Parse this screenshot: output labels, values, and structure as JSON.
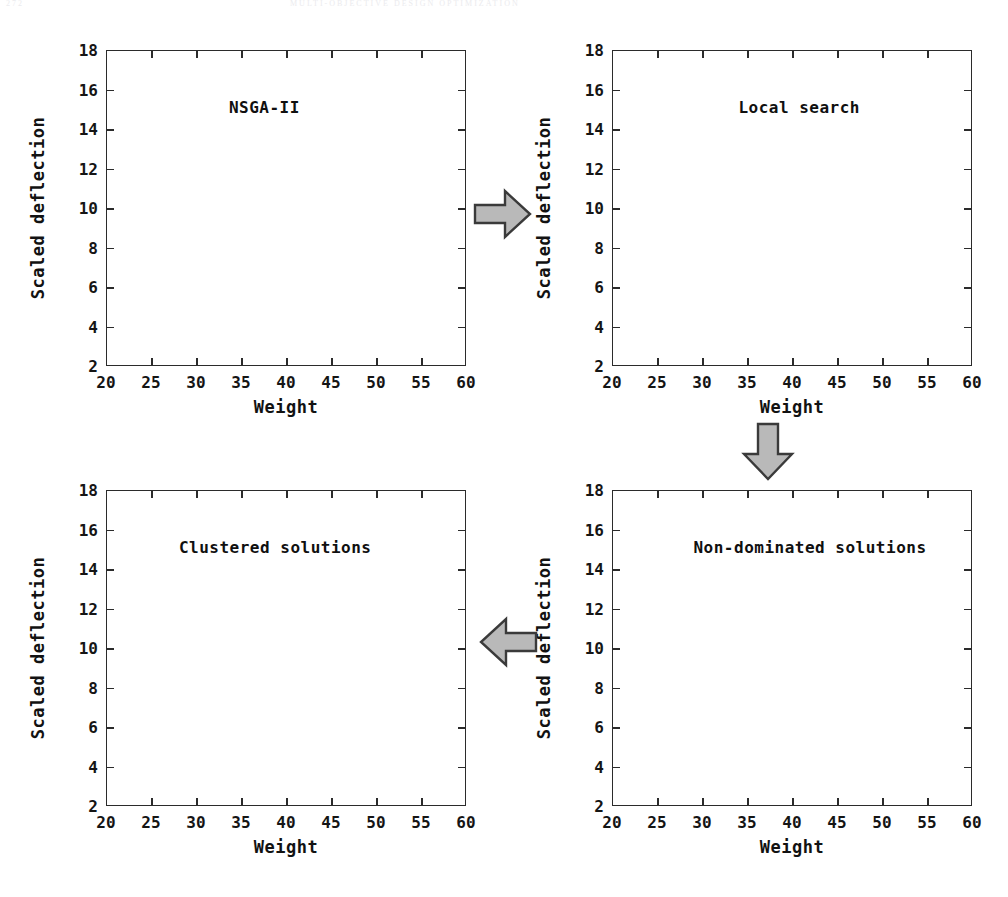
{
  "page_header": {
    "left": "272",
    "center": "MULTI-OBJECTIVE DESIGN OPTIMIZATION"
  },
  "axis": {
    "xlabel": "Weight",
    "ylabel": "Scaled deflection",
    "xticks": [
      20,
      25,
      30,
      35,
      40,
      45,
      50,
      55,
      60
    ],
    "yticks": [
      2,
      4,
      6,
      8,
      10,
      12,
      14,
      16,
      18
    ],
    "xlim": [
      20,
      60
    ],
    "ylim": [
      2,
      18
    ]
  },
  "arrows": [
    {
      "name": "arrow-nsga-to-local",
      "direction": "right"
    },
    {
      "name": "arrow-local-to-nondominated",
      "direction": "down"
    },
    {
      "name": "arrow-nondominated-to-clustered",
      "direction": "left"
    }
  ],
  "colors": {
    "axis": "#2b2b2b",
    "marker_stroke": "#4b4b52",
    "marker_fill": "#fbfbfb",
    "arrow_fill": "#b9b9b9",
    "arrow_stroke": "#3a3a3a",
    "text": "#111111"
  },
  "chart_data": [
    {
      "name": "nsga-ii",
      "type": "scatter",
      "title": "NSGA-II",
      "xlabel": "Weight",
      "ylabel": "Scaled deflection",
      "xlim": [
        20,
        60
      ],
      "ylim": [
        2,
        18
      ],
      "xticks": [
        20,
        25,
        30,
        35,
        40,
        45,
        50,
        55,
        60
      ],
      "yticks": [
        2,
        4,
        6,
        8,
        10,
        12,
        14,
        16,
        18
      ],
      "grid": false,
      "legend": "none",
      "points": [
        [
          24.9,
          10.9
        ],
        [
          25.9,
          10.2
        ],
        [
          27.7,
          9.3
        ],
        [
          28.3,
          7.85
        ],
        [
          28.8,
          7.6
        ],
        [
          29.5,
          6.65
        ],
        [
          30.2,
          6.5
        ],
        [
          30.5,
          6.45
        ],
        [
          31.0,
          6.05
        ],
        [
          31.6,
          5.05
        ],
        [
          33.6,
          4.6
        ],
        [
          33.9,
          4.15
        ],
        [
          35.2,
          3.8
        ],
        [
          35.6,
          3.75
        ],
        [
          36.0,
          3.7
        ],
        [
          37.5,
          3.35
        ],
        [
          38.2,
          3.3
        ],
        [
          40.2,
          3.25
        ],
        [
          41.9,
          3.15
        ],
        [
          42.6,
          3.05
        ],
        [
          43.5,
          3.0
        ],
        [
          44.0,
          2.95
        ],
        [
          44.8,
          2.95
        ],
        [
          46.5,
          2.85
        ],
        [
          46.9,
          2.85
        ],
        [
          48.2,
          2.8
        ],
        [
          49.4,
          2.7
        ],
        [
          50.0,
          2.68
        ],
        [
          51.5,
          2.6
        ],
        [
          53.0,
          2.58
        ],
        [
          55.0,
          2.5
        ],
        [
          55.7,
          2.48
        ]
      ]
    },
    {
      "name": "local-search",
      "type": "scatter",
      "title": "Local search",
      "xlabel": "Weight",
      "ylabel": "Scaled deflection",
      "xlim": [
        20,
        60
      ],
      "ylim": [
        2,
        18
      ],
      "xticks": [
        20,
        25,
        30,
        35,
        40,
        45,
        50,
        55,
        60
      ],
      "yticks": [
        2,
        4,
        6,
        8,
        10,
        12,
        14,
        16,
        18
      ],
      "grid": false,
      "legend": "none",
      "points": [
        [
          21.8,
          16.25
        ],
        [
          21.9,
          14.25
        ],
        [
          22.0,
          13.55
        ],
        [
          23.5,
          6.6
        ],
        [
          28.4,
          5.2
        ],
        [
          29.0,
          4.7
        ],
        [
          29.3,
          4.7
        ],
        [
          29.9,
          4.7
        ],
        [
          30.2,
          4.7
        ],
        [
          32.6,
          3.9
        ],
        [
          32.9,
          3.88
        ],
        [
          33.4,
          3.78
        ],
        [
          33.8,
          3.68
        ],
        [
          34.0,
          3.65
        ],
        [
          34.9,
          3.6
        ],
        [
          35.2,
          3.55
        ],
        [
          35.4,
          3.52
        ],
        [
          37.5,
          3.25
        ],
        [
          40.4,
          3.05
        ],
        [
          47.1,
          2.68
        ],
        [
          47.8,
          2.65
        ],
        [
          53.2,
          2.5
        ],
        [
          55.0,
          2.45
        ],
        [
          57.0,
          2.42
        ],
        [
          59.0,
          2.4
        ]
      ]
    },
    {
      "name": "non-dominated-solutions",
      "type": "scatter",
      "title": "Non-dominated solutions",
      "xlabel": "Weight",
      "ylabel": "Scaled deflection",
      "xlim": [
        20,
        60
      ],
      "ylim": [
        2,
        18
      ],
      "xticks": [
        20,
        25,
        30,
        35,
        40,
        45,
        50,
        55,
        60
      ],
      "yticks": [
        2,
        4,
        6,
        8,
        10,
        12,
        14,
        16,
        18
      ],
      "grid": false,
      "legend": "none",
      "points": [
        [
          21.8,
          16.25
        ],
        [
          21.9,
          14.25
        ],
        [
          22.0,
          13.55
        ],
        [
          23.5,
          6.6
        ],
        [
          28.4,
          5.2
        ],
        [
          29.0,
          4.7
        ],
        [
          29.3,
          4.7
        ],
        [
          29.9,
          4.7
        ],
        [
          30.2,
          4.7
        ],
        [
          32.6,
          3.9
        ],
        [
          32.9,
          3.88
        ],
        [
          33.4,
          3.78
        ],
        [
          33.8,
          3.68
        ],
        [
          34.0,
          3.65
        ],
        [
          34.9,
          3.6
        ],
        [
          35.2,
          3.55
        ],
        [
          35.4,
          3.52
        ],
        [
          37.5,
          3.25
        ],
        [
          40.4,
          3.05
        ],
        [
          47.1,
          2.68
        ],
        [
          47.8,
          2.65
        ],
        [
          53.2,
          2.5
        ],
        [
          55.0,
          2.45
        ],
        [
          57.0,
          2.42
        ],
        [
          59.0,
          2.4
        ]
      ]
    },
    {
      "name": "clustered-solutions",
      "type": "scatter",
      "title": "Clustered solutions",
      "xlabel": "Weight",
      "ylabel": "Scaled deflection",
      "xlim": [
        20,
        60
      ],
      "ylim": [
        2,
        18
      ],
      "xticks": [
        20,
        25,
        30,
        35,
        40,
        45,
        50,
        55,
        60
      ],
      "yticks": [
        2,
        4,
        6,
        8,
        10,
        12,
        14,
        16,
        18
      ],
      "grid": false,
      "legend": "none",
      "points": [
        [
          21.9,
          14.25
        ],
        [
          23.5,
          6.6
        ],
        [
          29.3,
          4.72
        ],
        [
          34.0,
          3.6
        ],
        [
          37.5,
          3.25
        ],
        [
          40.4,
          3.05
        ],
        [
          48.0,
          2.65
        ],
        [
          53.2,
          2.5
        ],
        [
          59.0,
          2.4
        ]
      ]
    }
  ]
}
